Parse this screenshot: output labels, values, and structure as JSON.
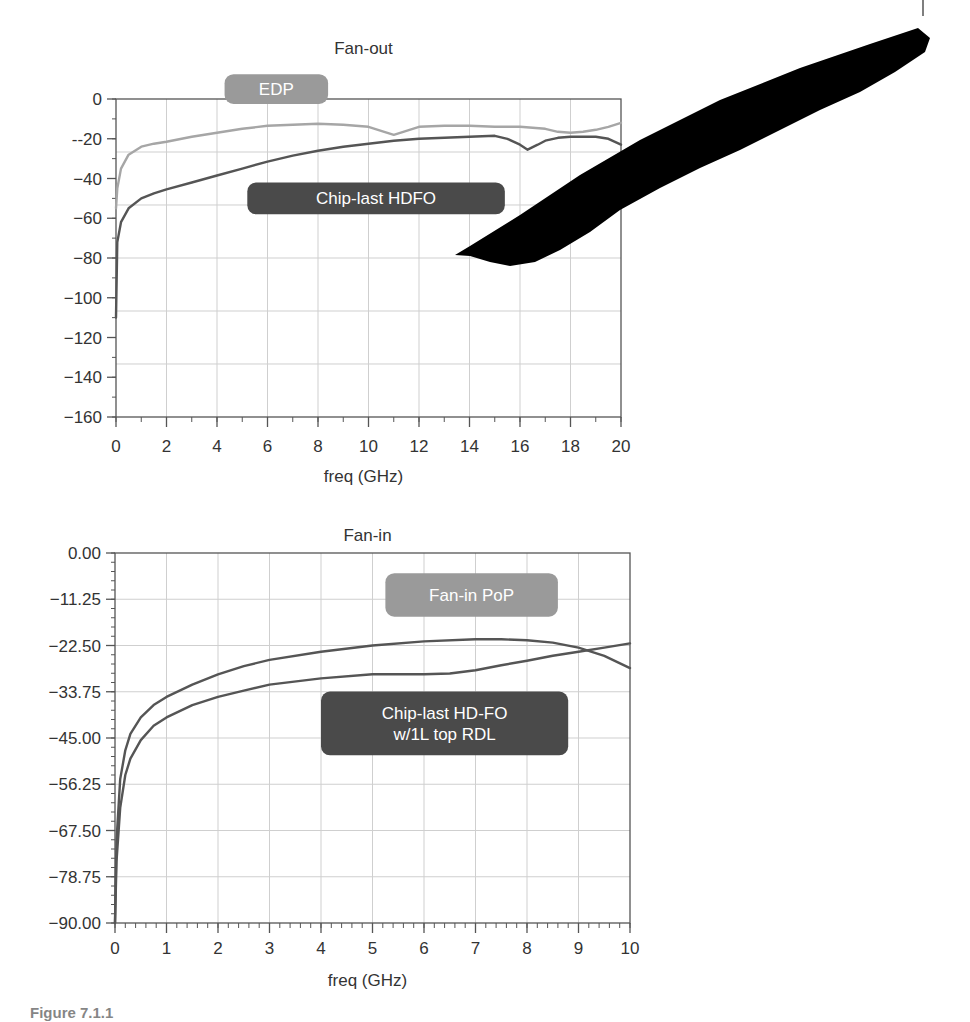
{
  "page": {
    "caption": "Figure 7.1.1"
  },
  "colors": {
    "axis": "#555555",
    "grid": "#cfcfcf",
    "text": "#333333",
    "light_series": "#a6a6a6",
    "dark_series": "#555555",
    "label_light_bg": "#9a9a9a",
    "label_dark_bg": "#4a4a4a",
    "label_text": "#ffffff",
    "redaction": "#000000"
  },
  "chart_data": [
    {
      "id": "fan-out",
      "type": "line",
      "title": "Fan-out",
      "xlabel": "freq (GHz)",
      "ylabel": "",
      "xlim": [
        0,
        20
      ],
      "ylim": [
        -160,
        0
      ],
      "x_ticks": [
        0,
        2,
        4,
        6,
        8,
        10,
        12,
        14,
        16,
        18,
        20
      ],
      "x_tick_labels": [
        "0",
        "2",
        "4",
        "6",
        "8",
        "10",
        "12",
        "14",
        "16",
        "18",
        "20"
      ],
      "y_ticks": [
        0,
        -20,
        -40,
        -60,
        -80,
        -100,
        -120,
        -140,
        -160
      ],
      "y_tick_labels": [
        "0",
        "--20",
        "−40",
        "−60",
        "−80",
        "−100",
        "−120",
        "−140",
        "−160"
      ],
      "grid": true,
      "h_grid": [
        -26.67,
        -53.33,
        -80,
        -106.67,
        -133.33
      ],
      "v_grid": [
        2,
        4,
        6,
        8,
        10,
        12,
        14,
        16,
        18
      ],
      "legend_position": "inline labels",
      "series": [
        {
          "name": "EDP",
          "color_key": "light_series",
          "x": [
            0,
            0.05,
            0.2,
            0.5,
            1,
            1.5,
            2,
            3,
            4,
            5,
            6,
            7,
            8,
            9,
            10,
            10.5,
            11,
            11.5,
            12,
            13,
            14,
            15,
            16,
            17,
            17.5,
            18,
            18.5,
            19,
            19.5,
            20
          ],
          "y": [
            -55,
            -45,
            -35,
            -28,
            -24,
            -22.5,
            -21.5,
            -19,
            -17,
            -15,
            -13.5,
            -13,
            -12.5,
            -13,
            -14,
            -16,
            -18,
            -16,
            -14,
            -13.5,
            -13.5,
            -14,
            -14,
            -15,
            -16.5,
            -17,
            -16.5,
            -15.5,
            -14,
            -12
          ]
        },
        {
          "name": "Chip-last HDFO",
          "color_key": "dark_series",
          "x": [
            0,
            0.05,
            0.2,
            0.5,
            1,
            1.5,
            2,
            3,
            4,
            5,
            6,
            7,
            8,
            9,
            10,
            11,
            12,
            13,
            14,
            15,
            15.5,
            16,
            16.3,
            16.7,
            17,
            17.5,
            18,
            19,
            19.5,
            20
          ],
          "y": [
            -110,
            -72,
            -62,
            -55,
            -50,
            -47.5,
            -45.5,
            -42,
            -38.5,
            -35,
            -31.5,
            -28.5,
            -26,
            -24,
            -22.5,
            -21,
            -20,
            -19.5,
            -19,
            -18.5,
            -20,
            -23,
            -25.5,
            -23,
            -21,
            -19.5,
            -19,
            -19,
            -20,
            -23
          ]
        }
      ],
      "labels": [
        {
          "text": "EDP",
          "style": "light",
          "x0": 4.3,
          "x1": 8.4,
          "y0": 12.5,
          "y1": -2.5
        },
        {
          "text": "Chip-last HDFO",
          "style": "dark",
          "x0": 5.2,
          "x1": 15.4,
          "y0": -42,
          "y1": -58
        }
      ]
    },
    {
      "id": "fan-in",
      "type": "line",
      "title": "Fan-in",
      "xlabel": "freq (GHz)",
      "ylabel": "",
      "xlim": [
        0,
        10
      ],
      "ylim": [
        -90,
        0
      ],
      "x_ticks": [
        0,
        1,
        2,
        3,
        4,
        5,
        6,
        7,
        8,
        9,
        10
      ],
      "x_tick_labels": [
        "0",
        "1",
        "2",
        "3",
        "4",
        "5",
        "6",
        "7",
        "8",
        "9",
        "10"
      ],
      "y_ticks": [
        0,
        -11.25,
        -22.5,
        -33.75,
        -45,
        -56.25,
        -67.5,
        -78.75,
        -90
      ],
      "y_tick_labels": [
        "0.00",
        "−11.25",
        "−22.50",
        "−33.75",
        "−45.00",
        "−56.25",
        "−67.50",
        "−78.75",
        "−90.00"
      ],
      "grid": true,
      "h_grid": [
        -11.25,
        -22.5,
        -33.75,
        -45,
        -56.25,
        -67.5,
        -78.75
      ],
      "v_grid": [
        1,
        2,
        3,
        4,
        5,
        6,
        7,
        8,
        9
      ],
      "legend_position": "inline labels",
      "series": [
        {
          "name": "Fan-in PoP",
          "color_key": "dark_series",
          "x": [
            0,
            0.03,
            0.1,
            0.2,
            0.3,
            0.5,
            0.75,
            1,
            1.5,
            2,
            2.5,
            3,
            4,
            5,
            6,
            7,
            7.5,
            8,
            8.5,
            9,
            9.5,
            10
          ],
          "y": [
            -90,
            -70,
            -55,
            -48,
            -44,
            -40,
            -37,
            -35,
            -32,
            -29.5,
            -27.5,
            -26,
            -24,
            -22.5,
            -21.5,
            -21,
            -21,
            -21.2,
            -21.8,
            -23,
            -25,
            -28
          ]
        },
        {
          "name": "Chip-last HD-FO w/1L top RDL",
          "color_key": "dark_series",
          "x": [
            0,
            0.03,
            0.1,
            0.2,
            0.3,
            0.5,
            0.75,
            1,
            1.5,
            2,
            2.5,
            3,
            4,
            5,
            6,
            6.5,
            7,
            7.5,
            8,
            8.5,
            9,
            9.5,
            10
          ],
          "y": [
            -90,
            -75,
            -62,
            -54,
            -50,
            -45.5,
            -42,
            -40,
            -37,
            -35,
            -33.5,
            -32,
            -30.5,
            -29.5,
            -29.5,
            -29.3,
            -28.5,
            -27.3,
            -26.2,
            -25,
            -24,
            -23,
            -22
          ]
        }
      ],
      "labels": [
        {
          "text": "Fan-in PoP",
          "style": "light",
          "x0": 5.25,
          "x1": 8.6,
          "y0": -4.9,
          "y1": -15.5
        },
        {
          "text": "Chip-last HD-FO",
          "text2": "w/1L top RDL",
          "style": "dark",
          "x0": 4.0,
          "x1": 8.8,
          "y0": -33.7,
          "y1": -49.2
        }
      ]
    }
  ]
}
